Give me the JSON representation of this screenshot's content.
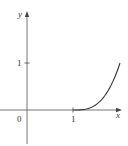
{
  "chart_data": {
    "type": "line",
    "title": "",
    "xlabel": "x",
    "ylabel": "y",
    "origin_label": "0",
    "x_ticks": [
      {
        "value": 1,
        "label": "1"
      }
    ],
    "y_ticks": [
      {
        "value": 1,
        "label": "1"
      }
    ],
    "xlim": [
      -0.6,
      2.05
    ],
    "ylim": [
      -0.7,
      2.1
    ],
    "grid": false,
    "legend": null,
    "series": [
      {
        "name": "curve",
        "x": [
          1.0,
          1.2,
          1.4,
          1.6,
          1.8,
          1.9,
          2.0
        ],
        "y": [
          0.0,
          0.008,
          0.064,
          0.216,
          0.512,
          0.729,
          1.0
        ]
      }
    ],
    "colors": {
      "axis": "#555555",
      "curve": "#333333",
      "text": "#333333"
    }
  }
}
